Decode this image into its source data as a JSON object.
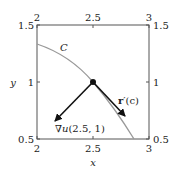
{
  "figure": {
    "x_axis": {
      "label": "x",
      "ticks": [
        "2",
        "2.5",
        "3"
      ],
      "range": [
        2,
        3
      ]
    },
    "y_axis": {
      "label": "y",
      "ticks": [
        "0.5",
        "1",
        "1.5"
      ],
      "range": [
        0.5,
        1.5
      ]
    },
    "top_ticks": [
      "2",
      "2.5",
      "3"
    ],
    "right_ticks": [
      "0.5",
      "1",
      "1.5"
    ],
    "curve": {
      "label": "C",
      "color": "#888888"
    },
    "point": {
      "x": 2.5,
      "y": 1
    },
    "vectors": {
      "gradient": {
        "label_nabla": "∇",
        "label_fn": "u",
        "label_args": "(2.5, 1)"
      },
      "tangent": {
        "label_r": "r",
        "label_rest": "′(c)"
      }
    }
  }
}
